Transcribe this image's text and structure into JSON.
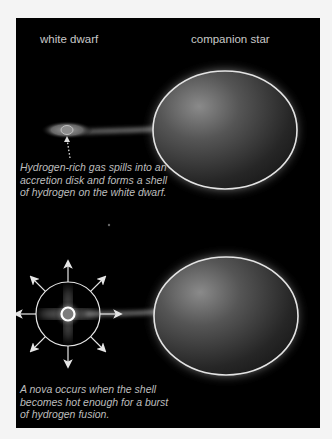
{
  "figure": {
    "labels": {
      "white_dwarf": "white dwarf",
      "companion_star": "companion star"
    },
    "captions": {
      "accretion": "Hydrogen-rich gas spills into an accretion disk and forms a shell of hydrogen on the white dwarf.",
      "nova": "A nova occurs when the shell becomes hot enough for a burst of hydrogen fusion."
    },
    "colors": {
      "background": "#000000",
      "page": "#f4f4f4",
      "text": "#c8c8c8",
      "star_glow": "#e8e8e8"
    },
    "panels": [
      {
        "stage": "accretion",
        "elements": [
          "white-dwarf-with-accretion-disk",
          "gas-stream",
          "companion-star"
        ]
      },
      {
        "stage": "nova",
        "elements": [
          "nova-burst-with-8-arrows",
          "gas-stream",
          "companion-star"
        ]
      }
    ]
  }
}
